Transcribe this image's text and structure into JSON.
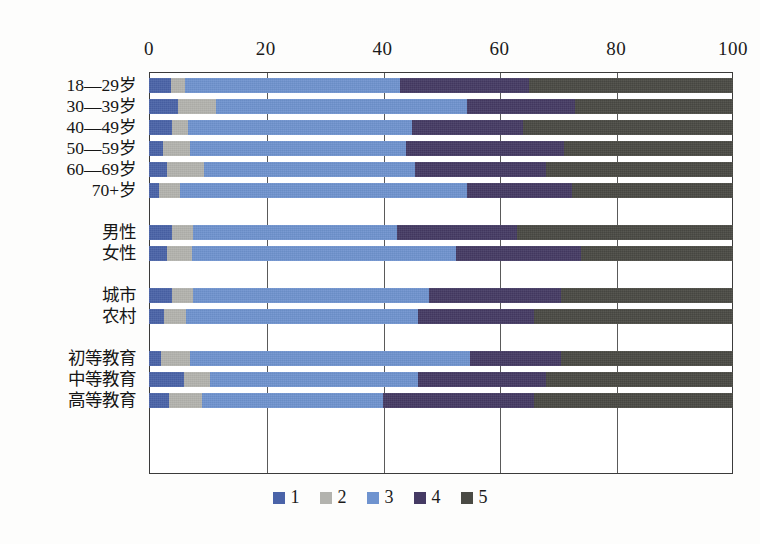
{
  "chart_data": {
    "type": "bar",
    "orientation": "horizontal",
    "stacked": true,
    "stacked_normalized": true,
    "title": "",
    "subtitle": "",
    "xlabel": "",
    "ylabel": "",
    "xlim": [
      0,
      100
    ],
    "xticks": [
      0,
      20,
      40,
      60,
      80,
      100
    ],
    "xtick_labels": [
      "0",
      "20",
      "40",
      "60",
      "80",
      "100"
    ],
    "grid": true,
    "grid_axis": "x",
    "legend_position": "bottom",
    "legend": [
      {
        "label": "1",
        "color": "#4a63a8"
      },
      {
        "label": "2",
        "color": "#b3b3ae"
      },
      {
        "label": "3",
        "color": "#6f93cf"
      },
      {
        "label": "4",
        "color": "#453a63"
      },
      {
        "label": "5",
        "color": "#4a4a44"
      }
    ],
    "series": [
      {
        "name": "1",
        "color": "#4a63a8",
        "values": [
          3.8,
          5.0,
          4.0,
          2.4,
          3.0,
          1.7,
          4.0,
          3.0,
          4.0,
          2.6,
          2.0,
          6.0,
          3.5
        ]
      },
      {
        "name": "2",
        "color": "#b3b3ae",
        "values": [
          2.4,
          6.5,
          2.7,
          4.6,
          6.5,
          3.6,
          3.5,
          4.4,
          3.5,
          3.8,
          5.0,
          4.5,
          5.5
        ]
      },
      {
        "name": "3",
        "color": "#6f93cf",
        "values": [
          36.8,
          43.0,
          38.3,
          37.0,
          36.0,
          49.2,
          35.0,
          45.1,
          40.5,
          39.6,
          48.0,
          35.5,
          31.0
        ]
      },
      {
        "name": "4",
        "color": "#453a63",
        "values": [
          22.0,
          18.5,
          19.0,
          27.0,
          22.5,
          18.0,
          20.5,
          21.5,
          22.5,
          20.0,
          15.5,
          22.0,
          26.0
        ]
      },
      {
        "name": "5",
        "color": "#4a4a44",
        "values": [
          35.0,
          27.0,
          36.0,
          29.0,
          32.0,
          27.5,
          37.0,
          26.0,
          29.5,
          34.0,
          29.5,
          32.0,
          34.0
        ]
      }
    ],
    "categories": [
      "18—29岁",
      "30—39岁",
      "40—49岁",
      "50—59岁",
      "60—69岁",
      "70+岁",
      "男性",
      "女性",
      "城市",
      "农村",
      "初等教育",
      "中等教育",
      "高等教育"
    ],
    "category_groups": [
      {
        "name": "age",
        "rows": [
          0,
          1,
          2,
          3,
          4,
          5
        ]
      },
      {
        "name": "gender",
        "rows": [
          6,
          7
        ]
      },
      {
        "name": "residence",
        "rows": [
          8,
          9
        ]
      },
      {
        "name": "education",
        "rows": [
          10,
          11,
          12
        ]
      }
    ],
    "row_layout": [
      {
        "index": 0,
        "label": "18—29岁",
        "top": 6
      },
      {
        "index": 1,
        "label": "30—39岁",
        "top": 27
      },
      {
        "index": 2,
        "label": "40—49岁",
        "top": 48
      },
      {
        "index": 3,
        "label": "50—59岁",
        "top": 69
      },
      {
        "index": 4,
        "label": "60—69岁",
        "top": 90
      },
      {
        "index": 5,
        "label": "70+岁",
        "top": 111
      },
      {
        "index": 6,
        "label": "男性",
        "top": 153
      },
      {
        "index": 7,
        "label": "女性",
        "top": 174
      },
      {
        "index": 8,
        "label": "城市",
        "top": 216
      },
      {
        "index": 9,
        "label": "农村",
        "top": 237
      },
      {
        "index": 10,
        "label": "初等教育",
        "top": 279
      },
      {
        "index": 11,
        "label": "中等教育",
        "top": 300
      },
      {
        "index": 12,
        "label": "高等教育",
        "top": 321
      }
    ]
  }
}
